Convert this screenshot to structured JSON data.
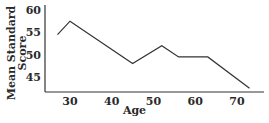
{
  "chart_data": {
    "type": "line",
    "title": "",
    "xlabel": "Age",
    "ylabel": "Mean Standard Score",
    "ylabel_lines": [
      "Mean Standard",
      "Score"
    ],
    "x_ticks": [
      30,
      40,
      50,
      60,
      70
    ],
    "y_ticks": [
      45,
      50,
      55,
      60
    ],
    "xlim": [
      24,
      76
    ],
    "ylim": [
      41,
      61
    ],
    "grid": false,
    "legend": null,
    "series": [
      {
        "name": "Mean Standard Score",
        "x": [
          27,
          30,
          45,
          52,
          56,
          63,
          73
        ],
        "y": [
          54.5,
          57.5,
          48,
          52,
          49.5,
          49.5,
          42.5
        ]
      }
    ],
    "colors": {
      "line": "#333333",
      "axis": "#333333"
    }
  }
}
